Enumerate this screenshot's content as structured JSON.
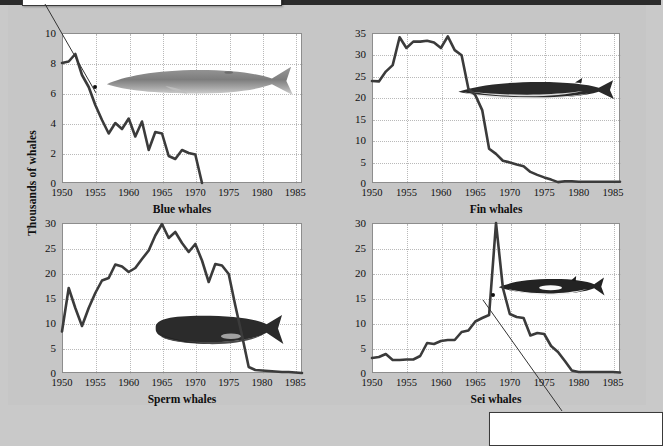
{
  "figure": {
    "ylabel": "Thousands of whales",
    "background_color": "#c6c6c6",
    "plot_background_color": "#ffffff",
    "line_color": "#3b3b3b",
    "grid_color": "#b9b9b9"
  },
  "callouts": [
    {
      "name": "top-left-callout",
      "text": ""
    },
    {
      "name": "bottom-right-callout",
      "text": ""
    }
  ],
  "chart_data": [
    {
      "type": "line",
      "title": "Blue whales",
      "xlabel": "",
      "ylabel": "Thousands of whales",
      "xlim": [
        1950,
        1986
      ],
      "ylim": [
        0,
        10
      ],
      "xticks": [
        "1950",
        "1955",
        "1960",
        "1965",
        "1970",
        "1975",
        "1980",
        "1985"
      ],
      "yticks": [
        "0",
        "2",
        "4",
        "6",
        "8",
        "10"
      ],
      "grid": true,
      "legend": "none",
      "annotation_point": {
        "x": 1955,
        "y": 6.4
      },
      "x": [
        1950,
        1951,
        1952,
        1953,
        1954,
        1955,
        1956,
        1957,
        1958,
        1959,
        1960,
        1961,
        1962,
        1963,
        1964,
        1965,
        1966,
        1967,
        1968,
        1969,
        1970,
        1971
      ],
      "values": [
        8.0,
        8.1,
        8.6,
        7.2,
        6.4,
        5.2,
        4.2,
        3.3,
        4.0,
        3.6,
        4.3,
        3.1,
        4.1,
        2.2,
        3.4,
        3.3,
        1.8,
        1.6,
        2.2,
        2.0,
        1.9,
        0.0
      ]
    },
    {
      "type": "line",
      "title": "Fin whales",
      "xlabel": "",
      "ylabel": "Thousands of whales",
      "xlim": [
        1950,
        1986
      ],
      "ylim": [
        0,
        35
      ],
      "xticks": [
        "1950",
        "1955",
        "1960",
        "1965",
        "1970",
        "1975",
        "1980",
        "1985"
      ],
      "yticks": [
        "0",
        "5",
        "10",
        "15",
        "20",
        "25",
        "30",
        "35"
      ],
      "grid": true,
      "legend": "none",
      "x": [
        1950,
        1951,
        1952,
        1953,
        1954,
        1955,
        1956,
        1957,
        1958,
        1959,
        1960,
        1961,
        1962,
        1963,
        1964,
        1965,
        1966,
        1967,
        1968,
        1969,
        1970,
        1971,
        1972,
        1973,
        1974,
        1975,
        1976,
        1977,
        1978,
        1979,
        1980,
        1981,
        1982,
        1983,
        1984,
        1985,
        1986
      ],
      "values": [
        23.8,
        23.7,
        26.0,
        27.5,
        34.0,
        31.5,
        33.0,
        33.0,
        33.2,
        32.8,
        31.5,
        34.2,
        31.0,
        29.8,
        22.0,
        20.5,
        17.0,
        8.0,
        6.8,
        5.2,
        4.8,
        4.3,
        3.9,
        2.6,
        1.9,
        1.3,
        0.8,
        0.2,
        0.4,
        0.4,
        0.3,
        0.3,
        0.3,
        0.3,
        0.3,
        0.3,
        0.3
      ]
    },
    {
      "type": "line",
      "title": "Sperm whales",
      "xlabel": "",
      "ylabel": "Thousands of whales",
      "xlim": [
        1950,
        1986
      ],
      "ylim": [
        0,
        30
      ],
      "xticks": [
        "1950",
        "1955",
        "1960",
        "1965",
        "1970",
        "1975",
        "1980",
        "1985"
      ],
      "yticks": [
        "0",
        "5",
        "10",
        "15",
        "20",
        "25",
        "30"
      ],
      "grid": true,
      "legend": "none",
      "x": [
        1950,
        1951,
        1952,
        1953,
        1954,
        1955,
        1956,
        1957,
        1958,
        1959,
        1960,
        1961,
        1962,
        1963,
        1964,
        1965,
        1966,
        1967,
        1968,
        1969,
        1970,
        1971,
        1972,
        1973,
        1974,
        1975,
        1976,
        1977,
        1978,
        1979,
        1980,
        1981,
        1982,
        1983,
        1984,
        1985,
        1986
      ],
      "values": [
        8.3,
        17.0,
        13.0,
        9.4,
        13.0,
        16.0,
        18.5,
        19.0,
        21.7,
        21.3,
        20.2,
        21.0,
        22.8,
        24.5,
        27.5,
        29.8,
        27.0,
        28.2,
        26.0,
        24.2,
        25.8,
        22.5,
        18.2,
        21.8,
        21.5,
        19.8,
        13.5,
        7.5,
        1.2,
        0.6,
        0.5,
        0.4,
        0.3,
        0.2,
        0.2,
        0.1,
        0.0
      ]
    },
    {
      "type": "line",
      "title": "Sei whales",
      "xlabel": "",
      "ylabel": "Thousands of whales",
      "xlim": [
        1950,
        1986
      ],
      "ylim": [
        0,
        30
      ],
      "xticks": [
        "1950",
        "1955",
        "1960",
        "1965",
        "1970",
        "1975",
        "1980",
        "1985"
      ],
      "yticks": [
        "0",
        "5",
        "10",
        "15",
        "20",
        "25",
        "30"
      ],
      "grid": true,
      "legend": "none",
      "annotation_point": {
        "x": 1967.6,
        "y": 15.6
      },
      "x": [
        1950,
        1951,
        1952,
        1953,
        1954,
        1955,
        1956,
        1957,
        1958,
        1959,
        1960,
        1961,
        1962,
        1963,
        1964,
        1965,
        1966,
        1967,
        1968,
        1969,
        1970,
        1971,
        1972,
        1973,
        1974,
        1975,
        1976,
        1977,
        1978,
        1979,
        1980,
        1981,
        1982,
        1983,
        1984,
        1985,
        1986
      ],
      "values": [
        3.0,
        3.2,
        3.8,
        2.6,
        2.6,
        2.7,
        2.7,
        3.4,
        6.0,
        5.8,
        6.4,
        6.6,
        6.6,
        8.2,
        8.5,
        10.3,
        11.0,
        11.6,
        30.0,
        17.0,
        11.8,
        11.2,
        11.0,
        7.5,
        8.0,
        7.8,
        5.4,
        4.2,
        2.4,
        0.5,
        0.2,
        0.2,
        0.2,
        0.2,
        0.2,
        0.2,
        0.1
      ]
    }
  ]
}
